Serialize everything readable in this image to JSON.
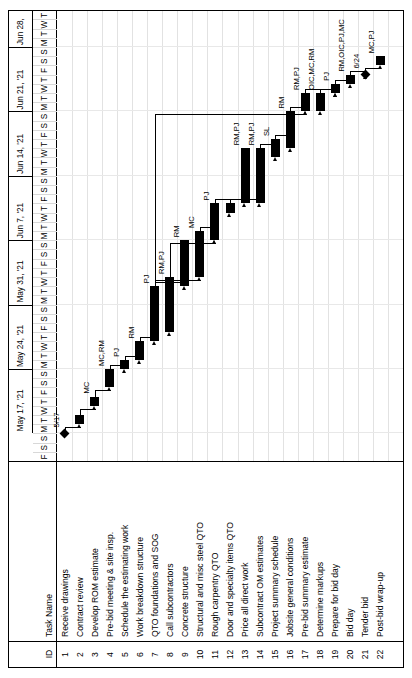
{
  "chart_data": {
    "type": "bar",
    "subtype": "gantt",
    "orientation": "rotated-90-ccw",
    "columns": [
      "ID",
      "Task Name"
    ],
    "axis": {
      "start": "2021-05-14",
      "end": "2021-07-01",
      "day_letters": [
        "F",
        "S",
        "S",
        "M",
        "T",
        "W",
        "T",
        "F",
        "S",
        "S",
        "M",
        "T",
        "W",
        "T",
        "F",
        "S",
        "S",
        "M",
        "T",
        "W",
        "T",
        "F",
        "S",
        "S",
        "M",
        "T",
        "W",
        "T",
        "F",
        "S",
        "S",
        "M",
        "T",
        "W",
        "T",
        "F",
        "S",
        "S",
        "M",
        "T",
        "W",
        "T",
        "F",
        "S",
        "S",
        "M",
        "T",
        "W",
        "T"
      ],
      "weeks": [
        {
          "label": "May 17, '21",
          "start_index": 3
        },
        {
          "label": "May 24, '21",
          "start_index": 10
        },
        {
          "label": "May 31, '21",
          "start_index": 17
        },
        {
          "label": "Jun 7, '21",
          "start_index": 24
        },
        {
          "label": "Jun 14, '21",
          "start_index": 31
        },
        {
          "label": "Jun 21, '21",
          "start_index": 38
        },
        {
          "label": "Jun 28,",
          "start_index": 45
        }
      ]
    },
    "milestones": [
      {
        "label": "5/17",
        "day_index": 3,
        "row": 1
      },
      {
        "label": "6/24",
        "day_index": 41,
        "row": 21
      }
    ],
    "tasks": [
      {
        "id": "1",
        "name": "Receive drawings",
        "start_day": 3,
        "duration": 0,
        "resources": "",
        "milestone": true,
        "date_label": "5/17"
      },
      {
        "id": "2",
        "name": "Contract review",
        "start_day": 4,
        "duration": 1,
        "resources": ""
      },
      {
        "id": "3",
        "name": "Develop ROM estimate",
        "start_day": 6,
        "duration": 1,
        "resources": "MC"
      },
      {
        "id": "4",
        "name": "Pre-bid meeting & site insp.",
        "start_day": 8,
        "duration": 2,
        "resources": "MC,RM"
      },
      {
        "id": "5",
        "name": "Schedule the estimating work",
        "start_day": 10,
        "duration": 1,
        "resources": "PJ"
      },
      {
        "id": "6",
        "name": "Work breakdown structure",
        "start_day": 11,
        "duration": 2,
        "resources": "RM"
      },
      {
        "id": "7",
        "name": "QTO foundations and SOG",
        "start_day": 13,
        "duration": 6,
        "resources": "PJ"
      },
      {
        "id": "8",
        "name": "Call subcontractors",
        "start_day": 14,
        "duration": 6,
        "resources": "RM,PJ"
      },
      {
        "id": "9",
        "name": "Concrete structure",
        "start_day": 19,
        "duration": 5,
        "resources": "RM"
      },
      {
        "id": "10",
        "name": "Structural and misc steel QTO",
        "start_day": 20,
        "duration": 5,
        "resources": "MC"
      },
      {
        "id": "11",
        "name": "Rough carpentry QTO",
        "start_day": 24,
        "duration": 4,
        "resources": "PJ"
      },
      {
        "id": "12",
        "name": "Door and specialty items QTO",
        "start_day": 27,
        "duration": 1,
        "resources": ""
      },
      {
        "id": "13",
        "name": "Price all direct work",
        "start_day": 28,
        "duration": 6,
        "resources": "RM,PJ"
      },
      {
        "id": "14",
        "name": "Subcontract OM estimates",
        "start_day": 28,
        "duration": 6,
        "resources": "RM,PJ"
      },
      {
        "id": "15",
        "name": "Project summary schedule",
        "start_day": 33,
        "duration": 2,
        "resources": "SL"
      },
      {
        "id": "16",
        "name": "Jobsite general conditions",
        "start_day": 34,
        "duration": 4,
        "resources": "RM"
      },
      {
        "id": "17",
        "name": "Pre-bid summary estimate",
        "start_day": 38,
        "duration": 2,
        "resources": "RM,PJ"
      },
      {
        "id": "18",
        "name": "Determine markups",
        "start_day": 38,
        "duration": 2,
        "resources": "OIC,MC,RM"
      },
      {
        "id": "19",
        "name": "Prepare for bid day",
        "start_day": 40,
        "duration": 1,
        "resources": "PJ"
      },
      {
        "id": "20",
        "name": "Bid day",
        "start_day": 41,
        "duration": 1,
        "resources": "RM,OIC,PJ,MC"
      },
      {
        "id": "21",
        "name": "Tender bid",
        "start_day": 42,
        "duration": 0,
        "resources": "",
        "milestone": true,
        "date_label": "6/24"
      },
      {
        "id": "22",
        "name": "Post-bid wrap-up",
        "start_day": 43,
        "duration": 1,
        "resources": "MC,PJ"
      }
    ],
    "xlabel": "",
    "ylabel": "",
    "legend": []
  },
  "table": {
    "header": {
      "id": "ID",
      "name": "Task Name"
    }
  }
}
